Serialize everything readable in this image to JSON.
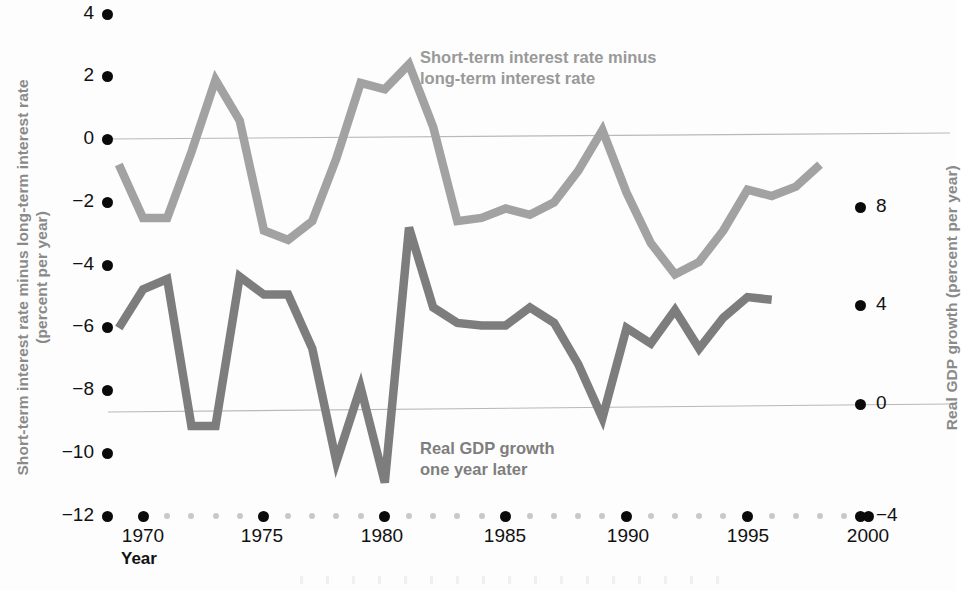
{
  "chart_data": {
    "type": "line",
    "title": "",
    "xlabel": "Year",
    "grid": true,
    "legend_position": "inline-annotation",
    "x": [
      1969,
      1970,
      1971,
      1972,
      1973,
      1974,
      1975,
      1976,
      1977,
      1978,
      1979,
      1980,
      1981,
      1982,
      1983,
      1984,
      1985,
      1986,
      1987,
      1988,
      1989,
      1990,
      1991,
      1992,
      1993,
      1994,
      1995,
      1996,
      1997,
      1998
    ],
    "xlim": [
      1968,
      2000.5
    ],
    "xticks_major": [
      1970,
      1975,
      1980,
      1985,
      1990,
      1995,
      2000
    ],
    "xtick_labels": [
      "1970",
      "1975",
      "1980",
      "1985",
      "1990",
      "1995",
      "2000"
    ],
    "axes": [
      {
        "id": "left",
        "label_line1": "Short-term interest rate minus long-term interest rate",
        "label_line2": "(percent per year)",
        "ticks": [
          4,
          2,
          0,
          -2,
          -4,
          -6,
          -8,
          -10,
          -12
        ],
        "tick_labels": [
          "4",
          "2",
          "0",
          "−2",
          "−4",
          "−6",
          "−8",
          "−10",
          "−12"
        ],
        "ylim": [
          -12,
          4
        ]
      },
      {
        "id": "right",
        "label": "Real GDP growth (percent per year)",
        "ticks": [
          8,
          4,
          0,
          -4
        ],
        "tick_labels": [
          "8",
          "4",
          "0",
          "−4"
        ],
        "ylim": [
          -4,
          8
        ]
      }
    ],
    "series": [
      {
        "name": "Short-term interest rate minus long-term interest rate",
        "annotation_line1": "Short-term interest rate minus",
        "annotation_line2": "long-term interest rate",
        "axis": "left",
        "color": "#a2a2a2",
        "x": [
          1969,
          1970,
          1971,
          1972,
          1973,
          1974,
          1975,
          1976,
          1977,
          1978,
          1979,
          1980,
          1981,
          1982,
          1983,
          1984,
          1985,
          1986,
          1987,
          1988,
          1989,
          1990,
          1991,
          1992,
          1993,
          1994,
          1995,
          1996,
          1997,
          1998
        ],
        "values": [
          -0.8,
          -2.5,
          -2.5,
          -0.4,
          1.9,
          0.6,
          -2.9,
          -3.2,
          -2.6,
          -0.6,
          1.8,
          1.6,
          2.4,
          0.4,
          -2.6,
          -2.5,
          -2.2,
          -2.4,
          -2.0,
          -1.0,
          0.3,
          -1.7,
          -3.3,
          -4.3,
          -3.9,
          -2.9,
          -1.6,
          -1.8,
          -1.5,
          -0.8
        ]
      },
      {
        "name": "Real GDP growth one year later",
        "annotation_line1": "Real GDP growth",
        "annotation_line2": "one year later",
        "axis": "right",
        "color": "#7d7d7d",
        "x": [
          1969,
          1970,
          1971,
          1972,
          1973,
          1974,
          1975,
          1976,
          1977,
          1978,
          1979,
          1980,
          1981,
          1982,
          1983,
          1984,
          1985,
          1986,
          1987,
          1988,
          1989,
          1990,
          1991,
          1992,
          1993,
          1994,
          1995,
          1996
        ],
        "values": [
          3.3,
          4.8,
          5.2,
          -0.5,
          -0.5,
          5.3,
          4.6,
          4.6,
          2.5,
          -1.9,
          1.0,
          -2.7,
          7.2,
          4.1,
          3.5,
          3.4,
          3.4,
          4.1,
          3.5,
          1.9,
          -0.2,
          3.3,
          2.7,
          4.0,
          2.5,
          3.7,
          4.5,
          4.4
        ]
      }
    ],
    "annotations": [
      {
        "text": "Year",
        "role": "x-axis-caption"
      }
    ]
  },
  "left_axis": {
    "title_line1": "Short-term interest rate minus long-term interest rate",
    "title_line2": "(percent per year)",
    "ticks": [
      {
        "label": "4",
        "y": 14
      },
      {
        "label": "2",
        "y": 76
      },
      {
        "label": "0",
        "y": 139
      },
      {
        "label": "−2",
        "y": 202
      },
      {
        "label": "−4",
        "y": 265
      },
      {
        "label": "−6",
        "y": 327
      },
      {
        "label": "−8",
        "y": 390
      },
      {
        "label": "−10",
        "y": 453
      },
      {
        "label": "−12",
        "y": 516
      }
    ]
  },
  "right_axis": {
    "title": "Real GDP growth (percent per year)",
    "ticks": [
      {
        "label": "8",
        "y": 207
      },
      {
        "label": "4",
        "y": 305
      },
      {
        "label": "0",
        "y": 404
      },
      {
        "label": "−4",
        "y": 516
      }
    ]
  },
  "x_axis": {
    "caption": "Year",
    "major_ticks": [
      {
        "label": "1970",
        "x": 143
      },
      {
        "label": "1975",
        "x": 262
      },
      {
        "label": "1980",
        "x": 382
      },
      {
        "label": "1985",
        "x": 505
      },
      {
        "label": "1990",
        "x": 628
      },
      {
        "label": "1995",
        "x": 748
      },
      {
        "label": "2000",
        "x": 868
      }
    ]
  },
  "series_labels": {
    "spread_line1": "Short-term interest rate minus",
    "spread_line2": "long-term interest rate",
    "gdp_line1": "Real GDP growth",
    "gdp_line2": "one year later"
  },
  "colors": {
    "spread": "#a2a2a2",
    "gdp": "#7d7d7d",
    "gridline": "#b9b9b9",
    "tick_dot": "#0a0a0a",
    "tick_dot_minor": "#c8c8c8",
    "axis_title": "#8a8a8a",
    "background": "#fdfdfd"
  }
}
